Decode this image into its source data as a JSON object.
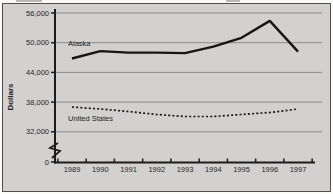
{
  "chart_data": {
    "type": "line",
    "title": "",
    "xlabel": "",
    "ylabel": "Dollars",
    "x": [
      "1989",
      "1990",
      "1991",
      "1992",
      "1993",
      "1994",
      "1995",
      "1996",
      "1997"
    ],
    "series": [
      {
        "name": "Alaska",
        "style": "solid",
        "values": [
          46800,
          48300,
          48000,
          48000,
          47900,
          49200,
          51000,
          54400,
          48200
        ]
      },
      {
        "name": "United States",
        "style": "dotted",
        "values": [
          37000,
          36600,
          36100,
          35500,
          35100,
          35100,
          35500,
          35900,
          36600
        ]
      }
    ],
    "y_ticks": [
      "56,000",
      "50,000",
      "44,000",
      "38,000",
      "32,000",
      "0"
    ],
    "y_tick_values": [
      56000,
      50000,
      44000,
      38000,
      32000,
      0
    ],
    "axis_break": true,
    "ylim_displayed": [
      32000,
      56000
    ],
    "grid": true,
    "legend": "inline-labels",
    "colors": {
      "panel_background": "#d2d1d0",
      "panel_border": "#4f4f4f",
      "grid": "#8c8b8a",
      "axis": "#1c1c1c",
      "series_line": "#161616",
      "text": "#1f1f1f"
    }
  }
}
